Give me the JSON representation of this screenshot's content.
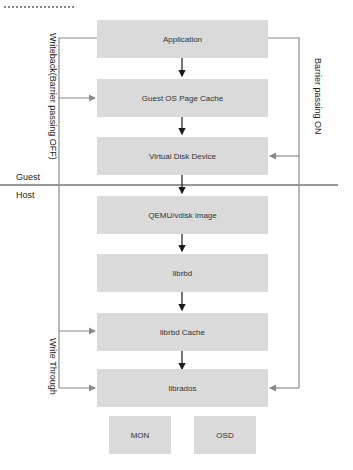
{
  "top_fragment": "設置說明",
  "boxes": {
    "application": "Application",
    "guest_os_page_cache": "Guest OS Page Cache",
    "virtual_disk_device": "Virtual Disk Device",
    "qemu_vdisk_image": "QEMU/vdisk image",
    "librbd": "librbd",
    "librbd_cache": "librbd Cache",
    "librados": "librados",
    "mon": "MON",
    "osd": "OSD"
  },
  "regions": {
    "guest": "Guest",
    "host": "Host"
  },
  "paths": {
    "writeback": "Writeback(Barrier passing OFF)",
    "barrier_on": "Barrier passing ON",
    "write_through": "Write Through"
  },
  "colors": {
    "box_fill": "#dadada",
    "arrow_main": "#1a1a1a",
    "arrow_side": "#8a8a8a"
  }
}
